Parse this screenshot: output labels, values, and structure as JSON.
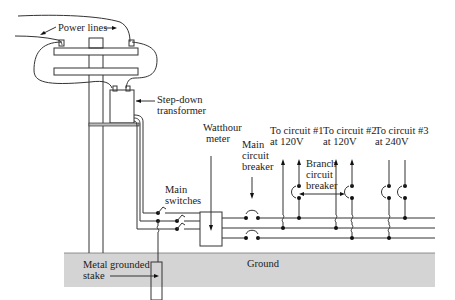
{
  "diagram": {
    "type": "residential-electrical-service-wiring",
    "labels": {
      "power_lines": "Power lines",
      "transformer_line1": "Step-down",
      "transformer_line2": "transformer",
      "meter_line1": "Watthour",
      "meter_line2": "meter",
      "main_switches_line1": "Main",
      "main_switches_line2": "switches",
      "main_breaker_line1": "Main",
      "main_breaker_line2": "circuit",
      "main_breaker_line3": "breaker",
      "branch_breaker_line1": "Branch",
      "branch_breaker_line2": "circuit",
      "branch_breaker_line3": "breaker",
      "circuit1_line1": "To circuit #1",
      "circuit1_line2": "at 120V",
      "circuit2_line1": "To circuit #2",
      "circuit2_line2": "at 120V",
      "circuit3_line1": "To circuit #3",
      "circuit3_line2": "at 240V",
      "ground": "Ground",
      "stake_line1": "Metal grounded",
      "stake_line2": "stake"
    },
    "colors": {
      "ground_fill": "#d4d4d4",
      "line": "#333333",
      "background": "#ffffff"
    }
  }
}
